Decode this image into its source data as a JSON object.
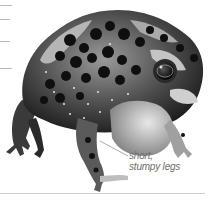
{
  "figure": {
    "annotation": {
      "line1": "short,",
      "line2": "stumpy legs"
    },
    "colors": {
      "background": "#ffffff",
      "skin_light": "#c9c9c9",
      "skin_mid": "#8a8a8a",
      "skin_dark": "#1a1a1a",
      "label_text": "#6e6e6e",
      "rule": "#b8b8b8"
    }
  }
}
